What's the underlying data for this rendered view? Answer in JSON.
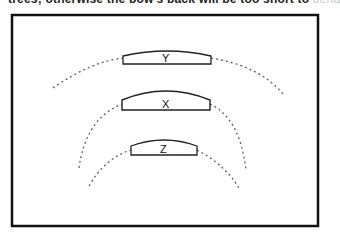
{
  "top_text": {
    "visible": "trees; otherwise the bow's back will be too short to",
    "faded": "bend"
  },
  "diagram": {
    "frame": {
      "x": 12,
      "y": 15,
      "width": 306,
      "height": 211,
      "stroke": "#111111"
    },
    "shapes": [
      {
        "id": "Y",
        "label": "Y",
        "x1": 123,
        "x2": 211,
        "base_y": 64,
        "top_y": 51,
        "shoulder_y": 56
      },
      {
        "id": "X",
        "label": "X",
        "x1": 122,
        "x2": 210,
        "base_y": 110,
        "top_y": 90,
        "shoulder_y": 100
      },
      {
        "id": "Z",
        "label": "Z",
        "x1": 131,
        "x2": 197,
        "base_y": 155,
        "top_y": 139,
        "shoulder_y": 146
      }
    ],
    "dotted_arcs": [
      {
        "id": "arc-outer",
        "description": "wide dotted arc through Y"
      },
      {
        "id": "arc-middle",
        "description": "dotted arc through X"
      },
      {
        "id": "arc-inner",
        "description": "dotted arc through Z"
      }
    ],
    "colors": {
      "stroke": "#222222",
      "dots": "#555555",
      "background": "#ffffff"
    }
  }
}
